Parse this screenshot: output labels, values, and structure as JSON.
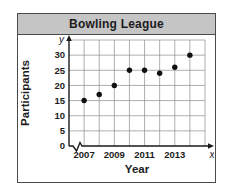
{
  "window": {
    "title": "Bowling League"
  },
  "chart_data": {
    "type": "scatter",
    "title": "Bowling League",
    "xlabel": "Year",
    "ylabel": "Participants",
    "x_axis_symbol": "x",
    "y_axis_symbol": "y",
    "x": [
      2007,
      2008,
      2009,
      2010,
      2011,
      2012,
      2013,
      2014
    ],
    "y": [
      15,
      17,
      20,
      25,
      25,
      24,
      26,
      30
    ],
    "x_gridline_years": [
      2007,
      2008,
      2009,
      2010,
      2011,
      2012,
      2013,
      2014,
      2015
    ],
    "x_ticks_labeled": [
      "2007",
      "2009",
      "2011",
      "2013"
    ],
    "y_ticks": [
      0,
      5,
      10,
      15,
      20,
      25,
      30
    ],
    "ylim": [
      0,
      35
    ],
    "grid": true,
    "axis_break_x": true,
    "legend": "none",
    "colors": {
      "point": "#111111",
      "grid": "#8c8c8c",
      "axis": "#1a1a1a",
      "text": "#1c1c1c",
      "title_bar_bg": "#c5c5c5",
      "card_border": "#4a4a4a",
      "background": "#ffffff"
    }
  }
}
